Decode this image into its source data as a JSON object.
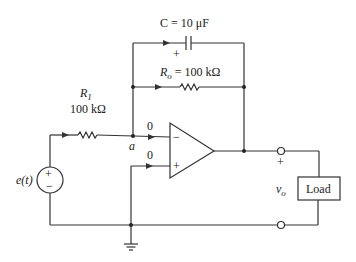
{
  "diagram": {
    "type": "op-amp integrator circuit",
    "capacitor": {
      "symbol": "C",
      "label": "C = 10 μF",
      "value": "10 μF",
      "polarity_mark": "+"
    },
    "feedback_resistor": {
      "symbol": "R_o",
      "label_main": "R",
      "label_sub": "o",
      "label_value": " = 100 kΩ"
    },
    "input_resistor": {
      "label_main": "R",
      "label_sub": "1",
      "value": "100 kΩ"
    },
    "source": {
      "label": "e(t)",
      "plus": "+",
      "minus": "−"
    },
    "node_a": "a",
    "inverting_current": "0",
    "noninverting_current": "0",
    "opamp": {
      "minus": "−",
      "plus": "+"
    },
    "output": {
      "plus": "+",
      "label_main": "v",
      "label_sub": "o"
    },
    "load": {
      "label": "Load"
    }
  }
}
